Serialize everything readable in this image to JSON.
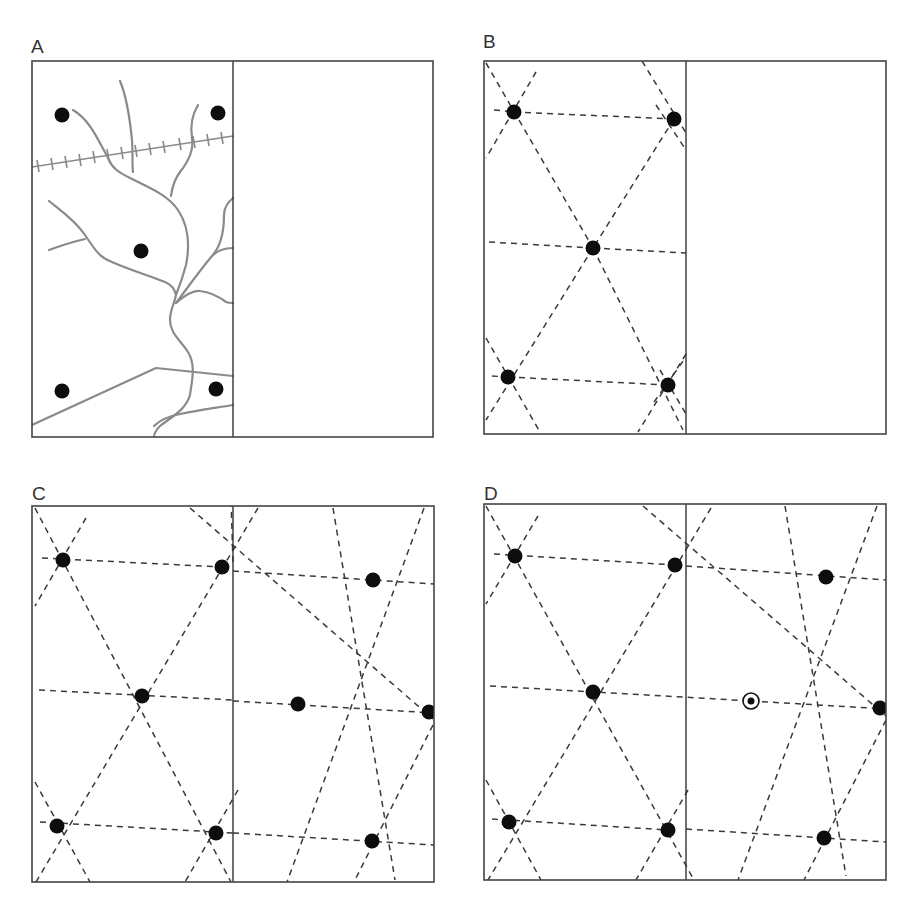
{
  "figure": {
    "panels": [
      {
        "id": "A",
        "label": "A",
        "label_pos": [
          31,
          53
        ],
        "frame": {
          "x": 32,
          "y": 61,
          "w": 401,
          "h": 376
        },
        "divider_x": 233,
        "nodes": [
          [
            62,
            115
          ],
          [
            218,
            113
          ],
          [
            141,
            251
          ],
          [
            62,
            391
          ],
          [
            216,
            389
          ]
        ],
        "features": {
          "rivers": [
            "M 73 110 C 90 120, 98 140, 108 158 C 112 168, 118 172, 130 178 C 150 188, 168 195, 178 210 C 188 225, 190 245, 186 265 C 182 280, 178 290, 176 295 C 174 305, 170 310, 170 320 C 170 333, 180 340, 188 352 C 196 365, 192 380, 190 395 C 186 410, 170 418, 160 426 C 154 432, 154 436, 154 437",
            "M 120 81 C 126 95, 130 120, 132 140 C 133 155, 132 165, 133 172",
            "M 198 105 C 192 115, 190 125, 192 138 C 194 150, 188 162, 180 172 C 174 180, 172 188, 171 196",
            "M 49 201 C 60 210, 75 220, 85 235 C 95 250, 100 258, 112 262 C 130 270, 150 276, 165 282 C 172 285, 175 290, 176 295",
            "M 49 250 C 60 246, 72 242, 85 239",
            "M 176 303 C 184 296, 192 290, 200 291 C 210 292, 218 296, 226 302 C 228 303, 230 303, 233 303",
            "M 176 303 C 186 290, 200 270, 212 256 C 218 250, 224 248, 233 248",
            "M 212 256 C 222 245, 224 230, 224 215 C 224 208, 228 202, 233 198",
            "M 154 426 C 160 420, 170 416, 180 414 C 198 410, 215 408, 233 405"
          ],
          "roads": [
            "M 32 425 L 156 368 L 233 376"
          ],
          "railway": {
            "path": "M 32 167 L 233 136",
            "ticks": [
              [
                38,
                166
              ],
              [
                52,
                164
              ],
              [
                66,
                162
              ],
              [
                80,
                160
              ],
              [
                94,
                157
              ],
              [
                108,
                155
              ],
              [
                122,
                153
              ],
              [
                136,
                151
              ],
              [
                150,
                149
              ],
              [
                164,
                147
              ],
              [
                180,
                144
              ],
              [
                194,
                142
              ],
              [
                208,
                140
              ],
              [
                222,
                138
              ]
            ]
          }
        }
      },
      {
        "id": "B",
        "label": "B",
        "label_pos": [
          483,
          48
        ],
        "frame": {
          "x": 484,
          "y": 61,
          "w": 402,
          "h": 373
        },
        "divider_x": 686,
        "nodes": [
          [
            514,
            112
          ],
          [
            674,
            119
          ],
          [
            593,
            248
          ],
          [
            508,
            377
          ],
          [
            668,
            385
          ]
        ],
        "dashed_lines": [
          [
            [
              494,
              110
            ],
            [
              514,
              112
            ]
          ],
          [
            [
              514,
              112
            ],
            [
              674,
              119
            ]
          ],
          [
            [
              489,
              242
            ],
            [
              593,
              248
            ]
          ],
          [
            [
              593,
              248
            ],
            [
              686,
              253
            ]
          ],
          [
            [
              492,
              376
            ],
            [
              508,
              377
            ]
          ],
          [
            [
              508,
              377
            ],
            [
              668,
              385
            ]
          ],
          [
            [
              486,
              63
            ],
            [
              593,
              248
            ]
          ],
          [
            [
              593,
              248
            ],
            [
              683,
              430
            ]
          ],
          [
            [
              536,
              72
            ],
            [
              486,
              158
            ]
          ],
          [
            [
              642,
              61
            ],
            [
              686,
              133
            ]
          ],
          [
            [
              674,
              119
            ],
            [
              593,
              248
            ]
          ],
          [
            [
              593,
              248
            ],
            [
              486,
              420
            ]
          ],
          [
            [
              486,
              338
            ],
            [
              540,
              432
            ]
          ],
          [
            [
              686,
              354
            ],
            [
              638,
              432
            ]
          ],
          [
            [
              656,
              105
            ],
            [
              686,
              150
            ]
          ],
          [
            [
              654,
              402
            ],
            [
              686,
              357
            ]
          ],
          [
            [
              660,
              370
            ],
            [
              686,
              414
            ]
          ]
        ]
      },
      {
        "id": "C",
        "label": "C",
        "label_pos": [
          32,
          500
        ],
        "frame": {
          "x": 32,
          "y": 506,
          "w": 402,
          "h": 376
        },
        "divider_x": 233,
        "nodes": [
          [
            63,
            560
          ],
          [
            222,
            567
          ],
          [
            142,
            696
          ],
          [
            57,
            826
          ],
          [
            216,
            833
          ],
          [
            373,
            580
          ],
          [
            298,
            704
          ],
          [
            429,
            712
          ],
          [
            372,
            841
          ]
        ],
        "dashed_lines": [
          [
            [
              42,
              558
            ],
            [
              222,
              567
            ]
          ],
          [
            [
              233,
              571
            ],
            [
              434,
              584
            ]
          ],
          [
            [
              39,
              690
            ],
            [
              233,
              700
            ]
          ],
          [
            [
              233,
              701
            ],
            [
              434,
              713
            ]
          ],
          [
            [
              40,
              822
            ],
            [
              233,
              833
            ]
          ],
          [
            [
              233,
              833
            ],
            [
              434,
              845
            ]
          ],
          [
            [
              35,
              508
            ],
            [
              231,
              882
            ]
          ],
          [
            [
              86,
              518
            ],
            [
              35,
              606
            ]
          ],
          [
            [
              190,
              508
            ],
            [
              433,
              719
            ]
          ],
          [
            [
              258,
              508
            ],
            [
              36,
              882
            ]
          ],
          [
            [
              424,
              508
            ],
            [
              287,
              882
            ]
          ],
          [
            [
              333,
              508
            ],
            [
              395,
              880
            ]
          ],
          [
            [
              433,
              725
            ],
            [
              354,
              882
            ]
          ],
          [
            [
              233,
              562
            ],
            [
              231,
              500
            ]
          ],
          [
            [
              35,
              782
            ],
            [
              90,
              882
            ]
          ],
          [
            [
              238,
              790
            ],
            [
              185,
              882
            ]
          ]
        ]
      },
      {
        "id": "D",
        "label": "D",
        "label_pos": [
          484,
          500
        ],
        "frame": {
          "x": 484,
          "y": 504,
          "w": 402,
          "h": 376
        },
        "divider_x": 686,
        "nodes": [
          [
            515,
            556
          ],
          [
            675,
            565
          ],
          [
            593,
            692
          ],
          [
            509,
            822
          ],
          [
            668,
            830
          ],
          [
            826,
            577
          ],
          [
            880,
            708
          ],
          [
            824,
            838
          ]
        ],
        "special_node": {
          "x": 751,
          "y": 701,
          "label": "new-central-place"
        },
        "dashed_lines": [
          [
            [
              494,
              554
            ],
            [
              675,
              565
            ]
          ],
          [
            [
              686,
              566
            ],
            [
              886,
              580
            ]
          ],
          [
            [
              490,
              686
            ],
            [
              751,
              701
            ]
          ],
          [
            [
              751,
              701
            ],
            [
              886,
              709
            ]
          ],
          [
            [
              492,
              819
            ],
            [
              668,
              830
            ]
          ],
          [
            [
              686,
              829
            ],
            [
              886,
              842
            ]
          ],
          [
            [
              486,
              506
            ],
            [
              694,
              880
            ]
          ],
          [
            [
              538,
              516
            ],
            [
              486,
              604
            ]
          ],
          [
            [
              643,
              506
            ],
            [
              886,
              716
            ]
          ],
          [
            [
              711,
              508
            ],
            [
              488,
              880
            ]
          ],
          [
            [
              877,
              506
            ],
            [
              738,
              880
            ]
          ],
          [
            [
              785,
              506
            ],
            [
              846,
              876
            ]
          ],
          [
            [
              886,
              720
            ],
            [
              804,
              880
            ]
          ],
          [
            [
              486,
              780
            ],
            [
              541,
              880
            ]
          ],
          [
            [
              688,
              790
            ],
            [
              636,
              880
            ]
          ]
        ]
      }
    ]
  },
  "legend_semantics": {
    "node": "settlement",
    "special_node": "central place (ring marker)",
    "dashed": "hexagonal/triangular lattice connections",
    "grey_lines": "rivers and roads",
    "ticked_line": "railway"
  }
}
